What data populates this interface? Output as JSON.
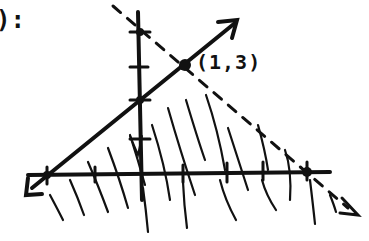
{
  "header": {
    "fragment": "):"
  },
  "graph": {
    "ink_color": "#111111",
    "background": "#ffffff",
    "point_label": "(1,3)",
    "solid_line": {
      "from": [
        30,
        190
      ],
      "to": [
        237,
        22
      ],
      "style": "solid",
      "arrows": "both"
    },
    "dashed_line": {
      "from": [
        115,
        5
      ],
      "to": [
        356,
        214
      ],
      "style": "dashed",
      "arrows": "end"
    },
    "x_axis": {
      "y": 175,
      "x_start": 28,
      "x_end": 330,
      "ticks": [
        47,
        95,
        140,
        183,
        227,
        263,
        307
      ],
      "dots": [
        47,
        307
      ]
    },
    "y_axis": {
      "x": 140,
      "y_start": 12,
      "y_end": 200,
      "ticks": [
        32,
        67,
        100,
        138
      ],
      "dots": [
        32,
        100
      ]
    },
    "highlighted_point": {
      "x": 185,
      "y": 65,
      "label": "(1,3)"
    },
    "shading": "hatched region below solid line and below dashed line"
  }
}
